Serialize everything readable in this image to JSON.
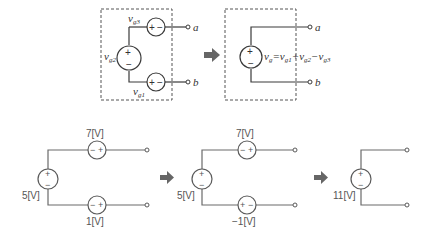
{
  "top_left": {
    "sources": [
      {
        "id": "vg3",
        "label": "v",
        "sub": "g3",
        "orientation": "+-"
      },
      {
        "id": "vg2",
        "label": "v",
        "sub": "g2",
        "orientation": "+ top"
      },
      {
        "id": "vg1",
        "label": "v",
        "sub": "g1",
        "orientation": "+-"
      }
    ],
    "terminals": {
      "a": "a",
      "b": "b"
    }
  },
  "top_right": {
    "source_label": "v",
    "source_sub": "g",
    "equation": {
      "eq": "=",
      "t1": "v",
      "t1_sub": "g1",
      "op1": "+",
      "t2": "v",
      "t2_sub": "g2",
      "op2": "−",
      "t3": "v",
      "t3_sub": "g3"
    },
    "terminals": {
      "a": "a",
      "b": "b"
    }
  },
  "bottom": {
    "circuit1": {
      "left_source": "5[V]",
      "top_source": "7[V]",
      "top_polarity": {
        "left": "−",
        "right": "+"
      },
      "bottom_source": "1[V]",
      "bottom_polarity": {
        "left": "−",
        "right": "+"
      }
    },
    "circuit2": {
      "left_source": "5[V]",
      "top_source": "7[V]",
      "top_polarity": {
        "left": "−",
        "right": "+"
      },
      "bottom_source": "−1[V]",
      "bottom_polarity": {
        "left": "+",
        "right": "−"
      }
    },
    "circuit3": {
      "left_source": "11[V]"
    }
  },
  "signs": {
    "plus": "+",
    "minus": "−"
  },
  "icons": {
    "arrow": "right-arrow-icon"
  }
}
